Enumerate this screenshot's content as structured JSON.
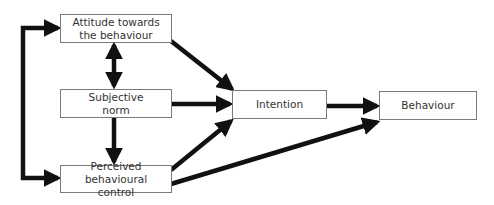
{
  "diagram": {
    "nodes": [
      {
        "id": "attitude",
        "label": "Attitude towards the behaviour"
      },
      {
        "id": "subjective_norm",
        "label": "Subjective norm"
      },
      {
        "id": "pbc",
        "label": "Perceived behavioural control"
      },
      {
        "id": "intention",
        "label": "Intention"
      },
      {
        "id": "behaviour",
        "label": "Behaviour"
      }
    ],
    "edges": [
      {
        "from": "attitude",
        "to": "subjective_norm",
        "type": "bidirectional"
      },
      {
        "from": "subjective_norm",
        "to": "pbc",
        "type": "directed"
      },
      {
        "from": "pbc",
        "to": "attitude",
        "type": "bidirectional",
        "route": "left-bracket"
      },
      {
        "from": "attitude",
        "to": "intention",
        "type": "directed"
      },
      {
        "from": "subjective_norm",
        "to": "intention",
        "type": "directed"
      },
      {
        "from": "pbc",
        "to": "intention",
        "type": "directed"
      },
      {
        "from": "intention",
        "to": "behaviour",
        "type": "directed"
      },
      {
        "from": "pbc",
        "to": "behaviour",
        "type": "directed"
      }
    ],
    "colors": {
      "arrow": "#111111",
      "box_border": "#7a7a7a",
      "text": "#333333"
    }
  }
}
